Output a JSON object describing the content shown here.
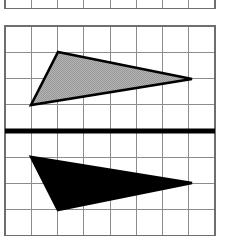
{
  "figure": {
    "canvas": {
      "width": 226,
      "height": 236,
      "background": "#ffffff"
    },
    "grids": [
      {
        "name": "partial-grid-top",
        "note": "clipped grid fragment at top edge of image",
        "x0": 5,
        "y0": -18,
        "cell": 26.25,
        "cols": 8,
        "rows": 1,
        "line_color": "#8c8c8c",
        "line_width": 1,
        "border_color": "#6e6e6e",
        "border_width": 1.4
      },
      {
        "name": "main-grid",
        "note": "main working grid, clipped at bottom edge of image",
        "x0": 5,
        "y0": 26,
        "cell": 26.25,
        "cols": 8,
        "rows": 8,
        "line_color": "#8c8c8c",
        "line_width": 1,
        "border_color": "#6e6e6e",
        "border_width": 1.4
      }
    ],
    "mirror_line": {
      "name": "line-of-reflection",
      "orientation": "horizontal",
      "y": 131,
      "x_start": 5,
      "x_end": 215,
      "color": "#000000",
      "stroke_width": 5
    },
    "shapes": [
      {
        "name": "gray-triangle-preimage",
        "label": "pre-image",
        "position": "above-mirror-line",
        "fill": "#a8a8a8",
        "stroke": "#000000",
        "stroke_width": 2.6,
        "vertices": [
          [
            58,
            52
          ],
          [
            192,
            79
          ],
          [
            31,
            105
          ]
        ]
      },
      {
        "name": "black-triangle-image",
        "label": "image",
        "position": "below-mirror-line",
        "fill": "#000000",
        "stroke": "#000000",
        "stroke_width": 2.6,
        "vertices": [
          [
            58,
            210
          ],
          [
            192,
            183
          ],
          [
            31,
            157
          ]
        ]
      }
    ],
    "colors": {
      "gray_fill": "#a8a8a8",
      "black": "#000000",
      "grid_line": "#8c8c8c",
      "grid_border": "#6e6e6e",
      "background": "#ffffff"
    }
  }
}
